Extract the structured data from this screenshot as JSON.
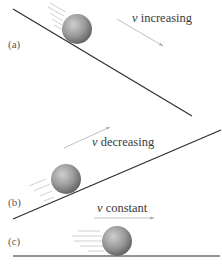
{
  "panels": [
    {
      "id": "a",
      "label": "(a)",
      "velocity_symbol": "v",
      "velocity_text": "increasing",
      "surface": "downhill incline"
    },
    {
      "id": "b",
      "label": "(b)",
      "velocity_symbol": "v",
      "velocity_text": "decreasing",
      "surface": "uphill incline"
    },
    {
      "id": "c",
      "label": "(c)",
      "velocity_symbol": "v",
      "velocity_text": "constant",
      "surface": "level ground"
    }
  ],
  "colors": {
    "surface": "#2a2a2a",
    "arrow": "#b8b8b8",
    "ball_light": "#c8c8c8",
    "ball_dark": "#6a6a6a",
    "motion_lines": "#c0c0c0"
  }
}
